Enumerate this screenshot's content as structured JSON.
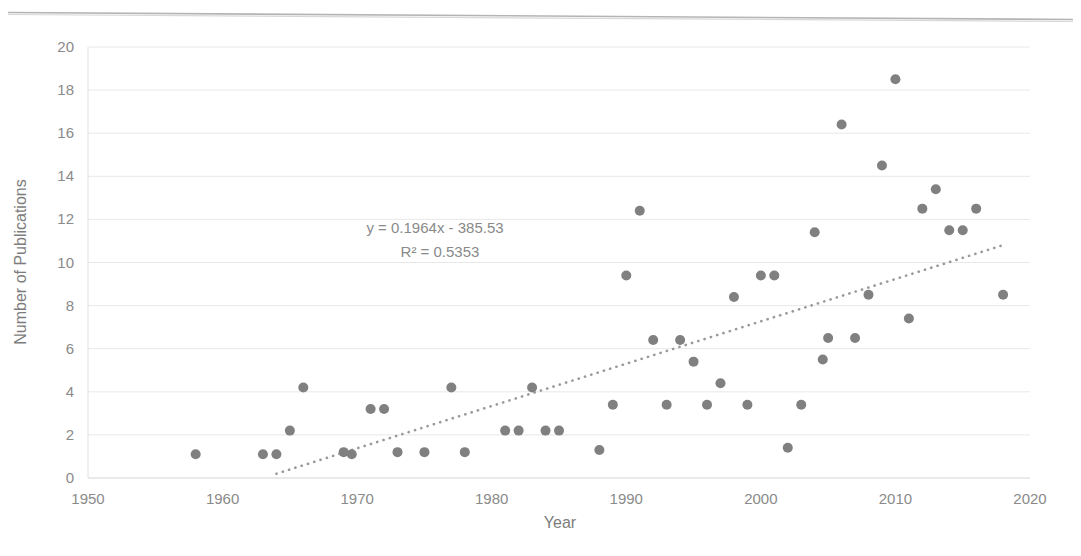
{
  "chart_data": {
    "type": "scatter",
    "title": "",
    "xlabel": "Year",
    "ylabel": "Number of Publications",
    "xlim": [
      1950,
      2020
    ],
    "ylim": [
      0,
      20
    ],
    "xticks": [
      1950,
      1960,
      1970,
      1980,
      1990,
      2000,
      2010,
      2020
    ],
    "yticks": [
      0,
      2,
      4,
      6,
      8,
      10,
      12,
      14,
      16,
      18,
      20
    ],
    "grid": true,
    "legend": "none",
    "marker_color": "#808080",
    "trendline_color": "#9a9a9a",
    "annotations": [
      "y = 0.1964x - 385.53",
      "R² = 0.5353"
    ],
    "trendline": {
      "style": "dotted",
      "slope": 0.1964,
      "intercept": -385.53,
      "r_squared": 0.5353,
      "x_start": 1964,
      "x_end": 2018
    },
    "points": [
      {
        "x": 1958,
        "y": 1.1
      },
      {
        "x": 1963,
        "y": 1.1
      },
      {
        "x": 1964,
        "y": 1.1
      },
      {
        "x": 1965,
        "y": 2.2
      },
      {
        "x": 1966,
        "y": 4.2
      },
      {
        "x": 1969,
        "y": 1.2
      },
      {
        "x": 1969.6,
        "y": 1.1
      },
      {
        "x": 1971,
        "y": 3.2
      },
      {
        "x": 1972,
        "y": 3.2
      },
      {
        "x": 1973,
        "y": 1.2
      },
      {
        "x": 1975,
        "y": 1.2
      },
      {
        "x": 1977,
        "y": 4.2
      },
      {
        "x": 1978,
        "y": 1.2
      },
      {
        "x": 1981,
        "y": 2.2
      },
      {
        "x": 1982,
        "y": 2.2
      },
      {
        "x": 1983,
        "y": 4.2
      },
      {
        "x": 1984,
        "y": 2.2
      },
      {
        "x": 1985,
        "y": 2.2
      },
      {
        "x": 1988,
        "y": 1.3
      },
      {
        "x": 1989,
        "y": 3.4
      },
      {
        "x": 1990,
        "y": 9.4
      },
      {
        "x": 1991,
        "y": 12.4
      },
      {
        "x": 1992,
        "y": 6.4
      },
      {
        "x": 1993,
        "y": 3.4
      },
      {
        "x": 1994,
        "y": 6.4
      },
      {
        "x": 1995,
        "y": 5.4
      },
      {
        "x": 1996,
        "y": 3.4
      },
      {
        "x": 1997,
        "y": 4.4
      },
      {
        "x": 1998,
        "y": 8.4
      },
      {
        "x": 1999,
        "y": 3.4
      },
      {
        "x": 2000,
        "y": 9.4
      },
      {
        "x": 2001,
        "y": 9.4
      },
      {
        "x": 2002,
        "y": 1.4
      },
      {
        "x": 2003,
        "y": 3.4
      },
      {
        "x": 2004,
        "y": 11.4
      },
      {
        "x": 2004.6,
        "y": 5.5
      },
      {
        "x": 2005,
        "y": 6.5
      },
      {
        "x": 2006,
        "y": 16.4
      },
      {
        "x": 2007,
        "y": 6.5
      },
      {
        "x": 2008,
        "y": 8.5
      },
      {
        "x": 2009,
        "y": 14.5
      },
      {
        "x": 2010,
        "y": 18.5
      },
      {
        "x": 2011,
        "y": 7.4
      },
      {
        "x": 2012,
        "y": 12.5
      },
      {
        "x": 2013,
        "y": 13.4
      },
      {
        "x": 2014,
        "y": 11.5
      },
      {
        "x": 2015,
        "y": 11.5
      },
      {
        "x": 2016,
        "y": 12.5
      },
      {
        "x": 2018,
        "y": 8.5
      }
    ]
  },
  "axes": {
    "y_title": "Number of Publications",
    "x_title": "Year",
    "y_tick_labels": [
      "0",
      "2",
      "4",
      "6",
      "8",
      "10",
      "12",
      "14",
      "16",
      "18",
      "20"
    ],
    "x_tick_labels": [
      "1950",
      "1960",
      "1970",
      "1980",
      "1990",
      "2000",
      "2010",
      "2020"
    ]
  },
  "equation": {
    "line1": "y = 0.1964x - 385.53",
    "line2": "R² = 0.5353"
  }
}
